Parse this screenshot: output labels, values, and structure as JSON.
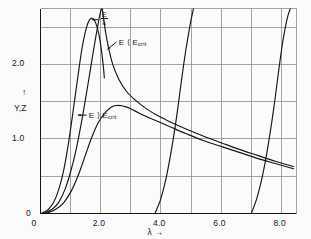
{
  "figure": {
    "background_color": "#fbfbfa",
    "line_color": "#16161a",
    "grid_color": "#8c8c92"
  },
  "chart_data": {
    "type": "line",
    "title": "",
    "subtitle": "",
    "xlabel": "λ",
    "xlabel_suffix": "→",
    "ylabel": "Y,Z",
    "ylabel_arrow": "↑",
    "xlim": [
      0,
      8.5
    ],
    "ylim": [
      0,
      2.75
    ],
    "grid": true,
    "grid_x_step": 1.0,
    "grid_y_step": 0.5,
    "legend_position": "inline-annotations",
    "xticks": [
      0,
      2.0,
      4.0,
      6.0,
      8.0
    ],
    "xtick_labels": [
      "0",
      "2.0",
      "4.0",
      "6.0",
      "8.0"
    ],
    "yticks": [
      0,
      1.0,
      2.0
    ],
    "ytick_labels": [
      "0",
      "1.0",
      "2.0"
    ],
    "annotations": [
      {
        "id": "e-over-lambda",
        "text_numerator": "E",
        "text_denominator": "λ",
        "kind": "fraction",
        "arrow": "←",
        "x": 1.95,
        "y": 2.62
      },
      {
        "id": "e-less-than-ecrit",
        "text": "E ⟨ E",
        "subscript": "crit",
        "arrow": "none",
        "x": 2.55,
        "y": 2.32
      },
      {
        "id": "e-greater-than-ecrit",
        "text": "E ⟩ E",
        "subscript": "crit",
        "arrow": "←",
        "x": 1.55,
        "y": 1.33
      }
    ],
    "series": [
      {
        "name": "E-less-than-Ecrit-peak",
        "description": "narrow tall resonance peak rising near lambda 1.0 and peaking about 2.62 near lambda 1.6",
        "points": [
          [
            0.02,
            0.0
          ],
          [
            0.25,
            0.05
          ],
          [
            0.45,
            0.16
          ],
          [
            0.62,
            0.34
          ],
          [
            0.78,
            0.6
          ],
          [
            0.92,
            0.92
          ],
          [
            1.04,
            1.25
          ],
          [
            1.16,
            1.6
          ],
          [
            1.28,
            1.95
          ],
          [
            1.38,
            2.22
          ],
          [
            1.48,
            2.42
          ],
          [
            1.58,
            2.56
          ],
          [
            1.68,
            2.62
          ],
          [
            1.78,
            2.6
          ],
          [
            1.88,
            2.5
          ],
          [
            1.96,
            2.36
          ],
          [
            2.02,
            2.2
          ],
          [
            2.08,
            2.0
          ],
          [
            2.12,
            1.82
          ]
        ]
      },
      {
        "name": "E-over-lambda-spike",
        "description": "very steep curve rising from origin region and exiting the top of the frame near lambda 2.05",
        "points": [
          [
            0.1,
            0.0
          ],
          [
            0.4,
            0.06
          ],
          [
            0.62,
            0.16
          ],
          [
            0.82,
            0.33
          ],
          [
            1.0,
            0.56
          ],
          [
            1.18,
            0.85
          ],
          [
            1.34,
            1.18
          ],
          [
            1.48,
            1.5
          ],
          [
            1.62,
            1.84
          ],
          [
            1.74,
            2.14
          ],
          [
            1.84,
            2.38
          ],
          [
            1.92,
            2.56
          ],
          [
            1.98,
            2.68
          ],
          [
            2.03,
            2.75
          ]
        ]
      },
      {
        "name": "E-over-lambda-descending",
        "description": "branch descending from the top of the frame near lambda 2.05 then decaying slowly to the right edge",
        "points": [
          [
            2.05,
            2.75
          ],
          [
            2.15,
            2.46
          ],
          [
            2.25,
            2.24
          ],
          [
            2.4,
            2.0
          ],
          [
            2.6,
            1.8
          ],
          [
            2.85,
            1.64
          ],
          [
            3.15,
            1.52
          ],
          [
            3.5,
            1.41
          ],
          [
            3.9,
            1.31
          ],
          [
            4.35,
            1.22
          ],
          [
            4.85,
            1.13
          ],
          [
            5.4,
            1.04
          ],
          [
            6.0,
            0.95
          ],
          [
            6.6,
            0.86
          ],
          [
            7.2,
            0.78
          ],
          [
            7.8,
            0.7
          ],
          [
            8.4,
            0.63
          ]
        ]
      },
      {
        "name": "E-greater-than-Ecrit-hump",
        "description": "broad hump peaking about 1.45 near lambda 2.6 then merging with the decaying tail",
        "points": [
          [
            0.16,
            0.0
          ],
          [
            0.48,
            0.05
          ],
          [
            0.76,
            0.14
          ],
          [
            1.02,
            0.3
          ],
          [
            1.26,
            0.52
          ],
          [
            1.48,
            0.77
          ],
          [
            1.7,
            1.02
          ],
          [
            1.92,
            1.22
          ],
          [
            2.14,
            1.35
          ],
          [
            2.36,
            1.43
          ],
          [
            2.58,
            1.45
          ],
          [
            2.84,
            1.43
          ],
          [
            3.12,
            1.38
          ],
          [
            3.46,
            1.31
          ],
          [
            3.86,
            1.24
          ],
          [
            4.32,
            1.16
          ],
          [
            4.84,
            1.07
          ],
          [
            5.4,
            0.98
          ],
          [
            6.0,
            0.9
          ],
          [
            6.6,
            0.82
          ],
          [
            7.2,
            0.74
          ],
          [
            7.8,
            0.67
          ],
          [
            8.4,
            0.6
          ]
        ]
      },
      {
        "name": "second-branch-rise",
        "description": "steep rising branch crossing the baseline near lambda 3.8 and exiting the top near lambda 5.1",
        "points": [
          [
            3.8,
            0.0
          ],
          [
            3.98,
            0.18
          ],
          [
            4.14,
            0.42
          ],
          [
            4.28,
            0.7
          ],
          [
            4.4,
            0.98
          ],
          [
            4.52,
            1.3
          ],
          [
            4.62,
            1.6
          ],
          [
            4.72,
            1.9
          ],
          [
            4.82,
            2.18
          ],
          [
            4.92,
            2.42
          ],
          [
            5.0,
            2.6
          ],
          [
            5.08,
            2.75
          ]
        ]
      },
      {
        "name": "third-branch-rise",
        "description": "steep rising branch crossing the baseline near lambda 7.0 and exiting the top near lambda 8.3",
        "points": [
          [
            7.0,
            0.0
          ],
          [
            7.18,
            0.2
          ],
          [
            7.34,
            0.45
          ],
          [
            7.48,
            0.73
          ],
          [
            7.6,
            1.02
          ],
          [
            7.72,
            1.34
          ],
          [
            7.82,
            1.64
          ],
          [
            7.92,
            1.95
          ],
          [
            8.02,
            2.24
          ],
          [
            8.12,
            2.48
          ],
          [
            8.22,
            2.66
          ],
          [
            8.3,
            2.75
          ]
        ]
      }
    ]
  }
}
